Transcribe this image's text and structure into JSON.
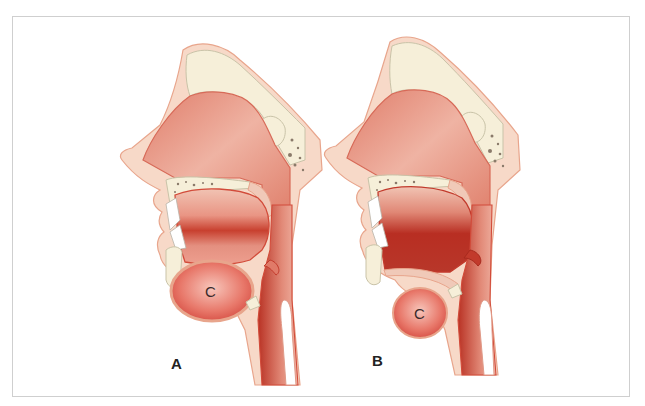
{
  "figure": {
    "panels": [
      {
        "id": "A",
        "label": "A",
        "structure_label": "C",
        "description": "Sagittal section of head, normal position; structure C large and positioned below the oral cavity"
      },
      {
        "id": "B",
        "label": "B",
        "structure_label": "C",
        "description": "Sagittal section of head; structure C smaller and displaced downward, oral cavity enlarged"
      }
    ],
    "colors": {
      "skin": "#f7d9c8",
      "skin_outline": "#e8a58c",
      "bone": "#f6efd9",
      "bone_outline": "#c9c3a8",
      "cavity": "#e88a78",
      "cavity_dark": "#c23a2c",
      "tissue": "#f0a08d",
      "frame_border": "#cfcfcf",
      "label_text": "#222222"
    }
  }
}
